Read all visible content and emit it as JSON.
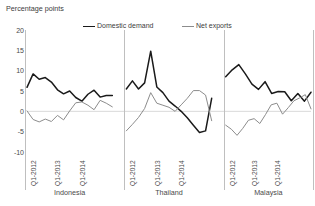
{
  "chart_data": {
    "type": "line",
    "title": "",
    "ylabel": "Percentage points",
    "xlabel": "",
    "ylim": [
      -10,
      20
    ],
    "yticks": [
      20,
      15,
      10,
      5,
      0,
      -5,
      -10
    ],
    "ytick_labels": [
      "20",
      "15",
      "10",
      "5",
      "0",
      "-5",
      "-10"
    ],
    "grid": false,
    "zero_line": true,
    "legend_position": "top-center",
    "legend": [
      {
        "name": "Domestic demand",
        "color": "#1a1a1a"
      },
      {
        "name": "Net exports",
        "color": "#8c8c8c"
      }
    ],
    "x": [
      "Q1-2012",
      "Q2-2012",
      "Q3-2012",
      "Q4-2012",
      "Q1-2013",
      "Q2-2013",
      "Q3-2013",
      "Q4-2013",
      "Q1-2014",
      "Q2-2014",
      "Q3-2014"
    ],
    "xtick_labels": [
      "Q1-2012",
      "Q1-2013",
      "Q1-2014"
    ],
    "xtick_positions": [
      0,
      4,
      8
    ],
    "panels": [
      {
        "name": "Indonesia",
        "series": [
          {
            "name": "Domestic demand",
            "color": "#1a1a1a",
            "values": [
              5.9,
              9.2,
              7.9,
              8.3,
              7.2,
              5.3,
              4.3,
              5.0,
              3.4,
              2.5,
              4.2,
              5.2,
              3.5,
              3.9,
              3.9
            ]
          },
          {
            "name": "Net exports",
            "color": "#8c8c8c",
            "values": [
              0.1,
              -2.0,
              -2.6,
              -1.9,
              -2.5,
              -1.0,
              -2.1,
              0.1,
              2.1,
              2.3,
              1.5,
              0.4,
              2.7,
              2.0,
              1.1
            ]
          }
        ]
      },
      {
        "name": "Thailand",
        "series": [
          {
            "name": "Domestic demand",
            "color": "#1a1a1a",
            "values": [
              5.5,
              7.5,
              5.5,
              7.0,
              14.8,
              6.0,
              4.6,
              2.5,
              1.3,
              0.0,
              -1.6,
              -3.4,
              -5.2,
              -4.8,
              3.2
            ]
          },
          {
            "name": "Net exports",
            "color": "#8c8c8c",
            "values": [
              -4.8,
              -3.2,
              -1.5,
              0.7,
              4.6,
              2.0,
              1.5,
              1.0,
              0.0,
              1.6,
              3.2,
              5.1,
              5.1,
              4.0,
              -2.3
            ]
          }
        ]
      },
      {
        "name": "Malaysia",
        "series": [
          {
            "name": "Domestic demand",
            "color": "#1a1a1a",
            "values": [
              8.5,
              10.2,
              11.5,
              9.2,
              6.7,
              5.4,
              7.3,
              4.4,
              4.9,
              4.8,
              2.6,
              4.4,
              2.5,
              4.7
            ]
          },
          {
            "name": "Net exports",
            "color": "#8c8c8c",
            "values": [
              -3.4,
              -4.4,
              -5.9,
              -4.2,
              -2.2,
              -1.8,
              -3.0,
              -0.8,
              1.6,
              2.0,
              -0.7,
              0.9,
              2.6,
              3.3,
              4.1,
              0.6
            ]
          }
        ]
      }
    ]
  },
  "axis": {
    "ylabel": "Percentage points"
  }
}
